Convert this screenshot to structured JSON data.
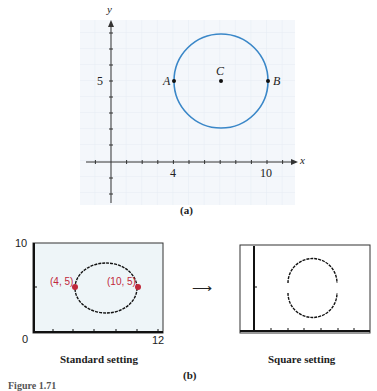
{
  "part_a": {
    "caption": "(a)",
    "x_axis_label": "x",
    "y_axis_label": "y",
    "x_ticks_labeled": [
      "4",
      "10"
    ],
    "y_ticks_labeled": [
      "5"
    ],
    "points": [
      {
        "name": "A",
        "x": 4,
        "y": 5
      },
      {
        "name": "C",
        "x": 7,
        "y": 5
      },
      {
        "name": "B",
        "x": 10,
        "y": 5
      }
    ],
    "circle": {
      "center": [
        7,
        5
      ],
      "radius": 3,
      "color": "#3a87c8"
    }
  },
  "part_b": {
    "caption": "(b)",
    "arrow": "⟶",
    "standard": {
      "label": "Standard setting",
      "y_max": "10",
      "x_min": "0",
      "x_max": "12",
      "point_left": "(4, 5)",
      "point_right": "(10, 5)",
      "point_color": "#c0283a"
    },
    "square": {
      "label": "Square setting"
    }
  },
  "figure_caption": "Figure 1.71"
}
